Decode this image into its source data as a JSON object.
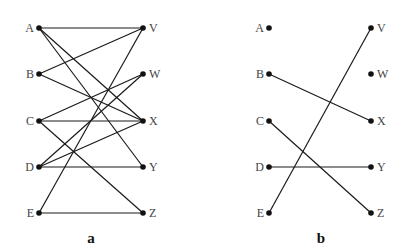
{
  "colors": {
    "edge": "#1a1a1a",
    "node": "#111111",
    "label": "#444444"
  },
  "diagrams": [
    {
      "id": "a",
      "caption": "a",
      "left_nodes": [
        {
          "label": "A",
          "x": 39,
          "y": 28
        },
        {
          "label": "B",
          "x": 39,
          "y": 74
        },
        {
          "label": "C",
          "x": 39,
          "y": 121
        },
        {
          "label": "D",
          "x": 39,
          "y": 167
        },
        {
          "label": "E",
          "x": 39,
          "y": 213
        }
      ],
      "right_nodes": [
        {
          "label": "V",
          "x": 143,
          "y": 28
        },
        {
          "label": "W",
          "x": 143,
          "y": 74
        },
        {
          "label": "X",
          "x": 143,
          "y": 121
        },
        {
          "label": "Y",
          "x": 143,
          "y": 167
        },
        {
          "label": "Z",
          "x": 143,
          "y": 213
        }
      ],
      "edges": [
        [
          "A",
          "V"
        ],
        [
          "A",
          "X"
        ],
        [
          "A",
          "Y"
        ],
        [
          "B",
          "V"
        ],
        [
          "B",
          "X"
        ],
        [
          "C",
          "W"
        ],
        [
          "C",
          "X"
        ],
        [
          "C",
          "Z"
        ],
        [
          "D",
          "W"
        ],
        [
          "D",
          "X"
        ],
        [
          "D",
          "Y"
        ],
        [
          "E",
          "V"
        ],
        [
          "E",
          "Z"
        ]
      ]
    },
    {
      "id": "b",
      "caption": "b",
      "left_nodes": [
        {
          "label": "A",
          "x": 269,
          "y": 28
        },
        {
          "label": "B",
          "x": 269,
          "y": 74
        },
        {
          "label": "C",
          "x": 269,
          "y": 121
        },
        {
          "label": "D",
          "x": 269,
          "y": 167
        },
        {
          "label": "E",
          "x": 269,
          "y": 213
        }
      ],
      "right_nodes": [
        {
          "label": "V",
          "x": 371,
          "y": 28
        },
        {
          "label": "W",
          "x": 371,
          "y": 74
        },
        {
          "label": "X",
          "x": 371,
          "y": 121
        },
        {
          "label": "Y",
          "x": 371,
          "y": 167
        },
        {
          "label": "Z",
          "x": 371,
          "y": 213
        }
      ],
      "edges": [
        [
          "B",
          "X"
        ],
        [
          "C",
          "Z"
        ],
        [
          "D",
          "Y"
        ],
        [
          "E",
          "V"
        ]
      ]
    }
  ]
}
